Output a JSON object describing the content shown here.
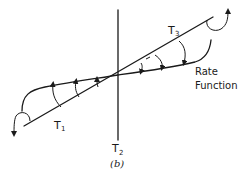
{
  "diagram": {
    "caption": "(b)",
    "labels": {
      "t1": {
        "main": "T",
        "sub": "1"
      },
      "t2": {
        "main": "T",
        "sub": "2"
      },
      "t3": {
        "main": "T",
        "sub": "3"
      },
      "rate_function_line1": "Rate",
      "rate_function_line2": "Function"
    },
    "elements": [
      "vertical-axis-T2",
      "straight-line-through-origin",
      "rate-function-curve",
      "arrows-left-pointing-up-toward-curve",
      "arrows-right-pointing-down-toward-curve",
      "curl-arrow-left-down",
      "curl-arrow-right-up"
    ],
    "colors": {
      "ink": "#1a1a1a",
      "background": "#ffffff"
    }
  }
}
